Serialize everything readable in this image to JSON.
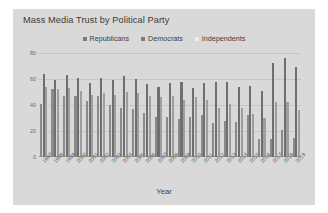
{
  "chart": {
    "title": "Mass Media Trust by Political Party",
    "xlabel": "Year",
    "ylabel": ""
  },
  "legend": {
    "items": [
      {
        "label": "Republicans",
        "color": "#7d7d7d"
      },
      {
        "label": "Democrats",
        "color": "#7d7d7d"
      },
      {
        "label": "Independents",
        "color": "#eeeeee"
      }
    ]
  },
  "yaxis": {
    "ticks": [
      "0",
      "20",
      "40",
      "60",
      "80"
    ]
  },
  "colors": {
    "panel": "#d9d9d9",
    "grid": "#c6c6c6",
    "republicans": "#8a8a8a",
    "democrats": "#6f6f6f",
    "independents": "#9e9e9e",
    "text": "#3d3d3d"
  },
  "chart_data": {
    "type": "bar",
    "title": "Mass Media Trust by Political Party",
    "xlabel": "Year",
    "ylabel": "",
    "ylim": [
      0,
      80
    ],
    "yticks": [
      0,
      20,
      40,
      60,
      80
    ],
    "grid": true,
    "legend_position": "top-center",
    "categories": [
      "1997",
      "1998",
      "1999",
      "2000",
      "2001",
      "2002",
      "2003",
      "2004",
      "2005",
      "2006",
      "2007",
      "2008",
      "2009",
      "2010",
      "2011",
      "2012",
      "2013",
      "2014",
      "2015",
      "2016",
      "2017",
      "2018",
      "2019"
    ],
    "series": [
      {
        "name": "Republicans",
        "values": [
          41,
          52,
          47,
          47,
          43,
          47,
          40,
          38,
          37,
          34,
          31,
          31,
          29,
          31,
          32,
          26,
          28,
          27,
          32,
          14,
          14,
          21,
          15
        ]
      },
      {
        "name": "Democrats",
        "values": [
          64,
          59,
          63,
          61,
          57,
          61,
          59,
          62,
          60,
          56,
          54,
          57,
          58,
          53,
          57,
          58,
          58,
          54,
          55,
          51,
          72,
          76,
          69
        ]
      },
      {
        "name": "Independents",
        "values": [
          54,
          52,
          53,
          51,
          48,
          49,
          48,
          50,
          49,
          47,
          46,
          47,
          44,
          46,
          44,
          38,
          41,
          38,
          33,
          30,
          42,
          42,
          36
        ]
      }
    ]
  }
}
